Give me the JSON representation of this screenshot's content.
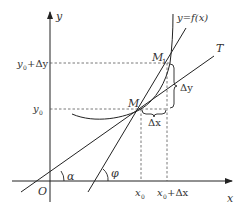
{
  "diagram": {
    "axes": {
      "x_label": "x",
      "y_label": "y",
      "origin_label": "O"
    },
    "curve_label": "y=f(x)",
    "points": {
      "M": "M",
      "M1": "M",
      "M1_sub": "1"
    },
    "tangent_label": "T",
    "angles": {
      "alpha": "α",
      "phi": "φ"
    },
    "ticks": {
      "x0": "x",
      "x0_sub": "0",
      "x0_plus": "x",
      "x0_plus_sub": "0",
      "x0_plus_rest": "+Δx",
      "y0": "y",
      "y0_sub": "0",
      "y0_plus": "y",
      "y0_plus_sub": "0",
      "y0_plus_rest": "+Δy"
    },
    "increments": {
      "dx": "Δx",
      "dy": "Δy"
    },
    "colors": {
      "stroke": "#2a2a2a",
      "dash": "#555555"
    }
  }
}
